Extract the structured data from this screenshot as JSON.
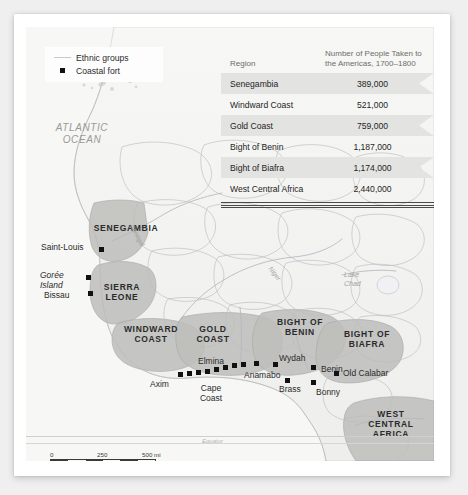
{
  "legend": {
    "items": [
      {
        "symbol": "line-swatch",
        "label": "Ethnic groups"
      },
      {
        "symbol": "square-marker",
        "label": "Coastal fort"
      }
    ]
  },
  "table": {
    "headers": [
      "Region",
      "Number of People Taken to\nthe Americas, 1700–1800"
    ],
    "header_region": "Region",
    "header_number_line1": "Number of People Taken to",
    "header_number_line2": "the Americas, 1700–1800",
    "rows": [
      {
        "region": "Senegambia",
        "number": "389,000"
      },
      {
        "region": "Windward Coast",
        "number": "521,000"
      },
      {
        "region": "Gold Coast",
        "number": "759,000"
      },
      {
        "region": "Bight of Benin",
        "number": "1,187,000"
      },
      {
        "region": "Bight of Biafra",
        "number": "1,174,000"
      },
      {
        "region": "West Central Africa",
        "number": "2,440,000"
      }
    ]
  },
  "map": {
    "ocean_label_line1": "ATLANTIC",
    "ocean_label_line2": "OCEAN",
    "regions": [
      {
        "name": "SENEGAMBIA"
      },
      {
        "name": "SIERRA LEONE",
        "line1": "SIERRA",
        "line2": "LEONE"
      },
      {
        "name": "WINDWARD COAST",
        "line1": "WINDWARD",
        "line2": "COAST"
      },
      {
        "name": "GOLD COAST",
        "line1": "GOLD",
        "line2": "COAST"
      },
      {
        "name": "BIGHT OF BENIN",
        "line1": "BIGHT OF",
        "line2": "BENIN"
      },
      {
        "name": "BIGHT OF BIAFRA",
        "line1": "BIGHT OF",
        "line2": "BIAFRA"
      },
      {
        "name": "WEST CENTRAL AFRICA",
        "line1": "WEST",
        "line2": "CENTRAL",
        "line3": "AFRICA"
      }
    ],
    "cities": [
      {
        "name": "Saint-Louis"
      },
      {
        "name": "Gorée Island",
        "line1": "Gorée",
        "line2": "Island"
      },
      {
        "name": "Bissau"
      },
      {
        "name": "Axim"
      },
      {
        "name": "Elmina"
      },
      {
        "name": "Cape Coast",
        "line1": "Cape",
        "line2": "Coast"
      },
      {
        "name": "Anamabo"
      },
      {
        "name": "Wydah"
      },
      {
        "name": "Benin"
      },
      {
        "name": "Brass"
      },
      {
        "name": "Bonny"
      },
      {
        "name": "Old Calabar"
      }
    ],
    "water_features": [
      {
        "name": "Lake Chad",
        "line1": "Lake",
        "line2": "Chad"
      },
      {
        "name": "Senegal"
      },
      {
        "name": "Niger"
      }
    ],
    "equator_label": "Equator"
  },
  "scale": {
    "miles": {
      "ticks": [
        "0",
        "250",
        "500 mi"
      ]
    },
    "km": {
      "ticks": [
        "0",
        "250",
        "500 km"
      ]
    }
  },
  "colors": {
    "page_background": "#efefef",
    "card": "#ffffff",
    "map_background": "#f3f3f1",
    "region_shade": "#bcbcba",
    "ocean_text": "#9a9a98",
    "fort_marker": "#111111",
    "table_band": "#e3e3e1"
  }
}
